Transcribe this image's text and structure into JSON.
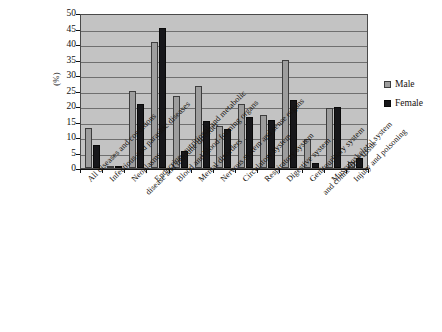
{
  "chart_data": {
    "type": "bar",
    "title": "",
    "xlabel": "",
    "ylabel": "(%)",
    "ylim": [
      0,
      50
    ],
    "yticks": [
      0,
      5,
      10,
      15,
      20,
      25,
      30,
      35,
      40,
      45,
      50
    ],
    "grid": true,
    "legend_position": "right",
    "categories": [
      "All diseases and conditions",
      "Infectious and parasitic diseases",
      "Neoplasms",
      "Endocrine, nutritional and metabolic disease and immune disorder",
      "Blood and blood-forming organs",
      "Mental disorders",
      "Nervous system and sense organs",
      "Circulatory system",
      "Respiratory system",
      "Digestive system",
      "Genitourinary system",
      "Musculoskeletal system and connective tissue",
      "Injury and poisoning"
    ],
    "series": [
      {
        "name": "Male",
        "color": "#9d9d9d",
        "values": [
          12.8,
          0.7,
          24.8,
          40.8,
          23.3,
          26.5,
          13.5,
          20.5,
          17.0,
          34.8,
          9.5,
          19.5,
          1.8
        ]
      },
      {
        "name": "Female",
        "color": "#17171a",
        "values": [
          7.5,
          0.6,
          20.7,
          45.2,
          5.6,
          15.2,
          12.5,
          16.6,
          15.5,
          21.9,
          1.5,
          19.6,
          3.2
        ]
      }
    ]
  },
  "legend": {
    "items": [
      {
        "label": "Male",
        "swatch": "male"
      },
      {
        "label": "Female",
        "swatch": "female"
      }
    ]
  },
  "axis": {
    "y_title": "(%)"
  },
  "caption": {
    "text": ""
  }
}
